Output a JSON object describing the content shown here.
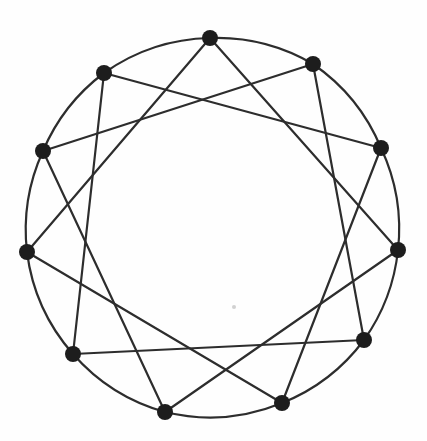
{
  "diagram": {
    "type": "circulant-graph",
    "label": "11-node circulant graph C11(1,3)",
    "background": "#fefefe",
    "edge_color": "#2d2d2d",
    "edge_width": 2.2,
    "node_color": "#1d1d1d",
    "node_radius": 8,
    "ring_arc_radius": 190,
    "nodes": [
      {
        "x": 210,
        "y": 38
      },
      {
        "x": 313,
        "y": 64
      },
      {
        "x": 381,
        "y": 148
      },
      {
        "x": 398,
        "y": 250
      },
      {
        "x": 364,
        "y": 340
      },
      {
        "x": 282,
        "y": 403
      },
      {
        "x": 165,
        "y": 412
      },
      {
        "x": 73,
        "y": 354
      },
      {
        "x": 27,
        "y": 252
      },
      {
        "x": 43,
        "y": 151
      },
      {
        "x": 104,
        "y": 73
      }
    ],
    "ring_edges": [
      [
        0,
        1
      ],
      [
        1,
        2
      ],
      [
        2,
        3
      ],
      [
        3,
        4
      ],
      [
        4,
        5
      ],
      [
        5,
        6
      ],
      [
        6,
        7
      ],
      [
        7,
        8
      ],
      [
        8,
        9
      ],
      [
        9,
        10
      ],
      [
        10,
        0
      ]
    ],
    "chord_edges": [
      [
        0,
        3
      ],
      [
        1,
        4
      ],
      [
        2,
        5
      ],
      [
        3,
        6
      ],
      [
        4,
        7
      ],
      [
        5,
        8
      ],
      [
        6,
        9
      ],
      [
        7,
        10
      ],
      [
        8,
        0
      ],
      [
        9,
        1
      ],
      [
        10,
        2
      ]
    ],
    "speck": {
      "x": 234,
      "y": 307,
      "radius": 2,
      "color": "#c6c6c6"
    }
  }
}
